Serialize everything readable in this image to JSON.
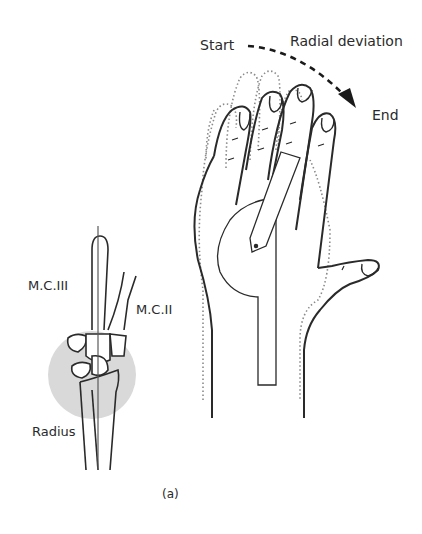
{
  "figure": {
    "caption": "(a)",
    "labels": {
      "start": "Start",
      "motion": "Radial deviation",
      "end": "End",
      "mc3": "M.C.III",
      "mc2": "M.C.II",
      "radius": "Radius"
    },
    "colors": {
      "line": "#2a2a2a",
      "dotted": "#8a8a8a",
      "shade": "#d9d9d9",
      "background": "#ffffff"
    }
  }
}
